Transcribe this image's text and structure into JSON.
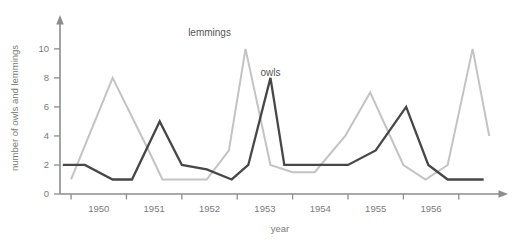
{
  "chart_data": {
    "type": "line",
    "title": "",
    "xlabel": "year",
    "ylabel": "number of owls and lemmings",
    "xlim": [
      1949.3,
      1957.1
    ],
    "ylim": [
      0,
      11.3
    ],
    "xticks": [
      1950,
      1951,
      1952,
      1953,
      1954,
      1955,
      1956
    ],
    "xtick_labels": [
      "1950",
      "1951",
      "1952",
      "1953",
      "1954",
      "1955",
      "1956"
    ],
    "xminorticks": [
      1949.5,
      1950.5,
      1951.5,
      1952.5,
      1953.5,
      1954.5,
      1955.5,
      1956.5
    ],
    "yticks": [
      0,
      2,
      4,
      6,
      8,
      10
    ],
    "ytick_labels": [
      "0",
      "2",
      "4",
      "6",
      "8",
      "10"
    ],
    "grid": false,
    "legend_position": "inline-annotation",
    "series": [
      {
        "name": "lemmings",
        "color": "#c3c3c3",
        "annotation_label": "lemmings",
        "annotation_x": 1952.0,
        "annotation_y": 10.9,
        "x": [
          1949.5,
          1950.25,
          1950.9,
          1951.15,
          1951.95,
          1952.35,
          1952.65,
          1953.1,
          1953.5,
          1953.9,
          1954.45,
          1954.9,
          1955.5,
          1955.9,
          1956.3,
          1956.75,
          1957.05
        ],
        "y": [
          1,
          8,
          3,
          1,
          1,
          3,
          10,
          2,
          1.5,
          1.5,
          4,
          7,
          2,
          1,
          2,
          10,
          4
        ]
      },
      {
        "name": "owls",
        "color": "#474747",
        "annotation_label": "owls",
        "annotation_x": 1953.1,
        "annotation_y": 8.1,
        "x": [
          1949.35,
          1949.75,
          1950.25,
          1950.6,
          1951.1,
          1951.5,
          1951.95,
          1952.4,
          1952.7,
          1953.1,
          1953.35,
          1953.9,
          1954.5,
          1955.0,
          1955.55,
          1955.95,
          1956.3,
          1956.95
        ],
        "y": [
          2,
          2,
          1,
          1,
          5,
          2,
          1.7,
          1,
          2,
          8,
          2,
          2,
          2,
          3,
          6,
          2,
          1,
          1
        ]
      }
    ]
  }
}
